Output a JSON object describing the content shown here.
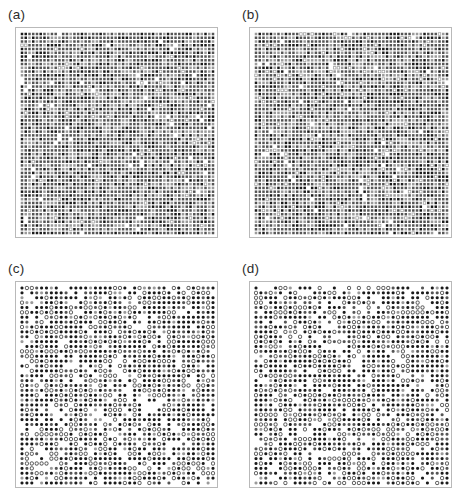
{
  "figure": {
    "width": 465,
    "height": 503,
    "background_color": "#ffffff",
    "frame_color": "#b9b9b9",
    "marker_dark_color": "#1a1a1a",
    "marker_mid_color": "#555555",
    "marker_light_color": "#9a9a9a"
  },
  "panels": [
    {
      "id": "a",
      "label": "(a)",
      "label_x": 8,
      "label_y": 8,
      "frame_x": 15,
      "frame_y": 27,
      "frame_w": 203,
      "frame_h": 211,
      "inset": 6,
      "cols": 52,
      "rows": 54,
      "fill_fraction": 0.955,
      "open_fraction": 0.03,
      "marker_size": 2.5,
      "seed": 1741
    },
    {
      "id": "b",
      "label": "(b)",
      "label_x": 242,
      "label_y": 8,
      "frame_x": 249,
      "frame_y": 27,
      "frame_w": 203,
      "frame_h": 211,
      "inset": 6,
      "cols": 52,
      "rows": 54,
      "fill_fraction": 0.93,
      "open_fraction": 0.05,
      "marker_size": 2.5,
      "seed": 9203
    },
    {
      "id": "c",
      "label": "(c)",
      "label_x": 8,
      "label_y": 262,
      "frame_x": 15,
      "frame_y": 281,
      "frame_w": 203,
      "frame_h": 207,
      "inset": 6,
      "cols": 40,
      "rows": 41,
      "fill_fraction": 0.6,
      "open_fraction": 0.26,
      "marker_size": 3.3,
      "seed": 4517
    },
    {
      "id": "d",
      "label": "(d)",
      "label_x": 242,
      "label_y": 262,
      "frame_x": 249,
      "frame_y": 281,
      "frame_w": 203,
      "frame_h": 207,
      "inset": 6,
      "cols": 40,
      "rows": 41,
      "fill_fraction": 0.62,
      "open_fraction": 0.25,
      "marker_size": 3.3,
      "seed": 6833
    }
  ],
  "chart_data": {
    "type": "heatmap",
    "title": "",
    "subtitle": "",
    "xlabel": "",
    "ylabel": "",
    "grid": false,
    "legend_position": "none",
    "panels": [
      {
        "name": "(a)",
        "lattice_columns": 52,
        "lattice_rows": 54,
        "total_sites": 2808,
        "occupied_fraction": 0.955,
        "open_site_fraction": 0.03,
        "vacancy_fraction": 0.045,
        "marker_states": [
          "filled",
          "open",
          "vacant"
        ]
      },
      {
        "name": "(b)",
        "lattice_columns": 52,
        "lattice_rows": 54,
        "total_sites": 2808,
        "occupied_fraction": 0.93,
        "open_site_fraction": 0.05,
        "vacancy_fraction": 0.07,
        "marker_states": [
          "filled",
          "open",
          "vacant"
        ]
      },
      {
        "name": "(c)",
        "lattice_columns": 40,
        "lattice_rows": 41,
        "total_sites": 1640,
        "occupied_fraction": 0.6,
        "open_site_fraction": 0.26,
        "vacancy_fraction": 0.14,
        "marker_states": [
          "filled",
          "open",
          "vacant"
        ]
      },
      {
        "name": "(d)",
        "lattice_columns": 40,
        "lattice_rows": 41,
        "total_sites": 1640,
        "occupied_fraction": 0.62,
        "open_site_fraction": 0.25,
        "vacancy_fraction": 0.13,
        "marker_states": [
          "filled",
          "open",
          "vacant"
        ]
      }
    ],
    "series": [
      {
        "name": "(a)",
        "values": [
          0.955,
          0.03,
          0.045
        ]
      },
      {
        "name": "(b)",
        "values": [
          0.93,
          0.05,
          0.07
        ]
      },
      {
        "name": "(c)",
        "values": [
          0.6,
          0.26,
          0.14
        ]
      },
      {
        "name": "(d)",
        "values": [
          0.62,
          0.25,
          0.13
        ]
      }
    ],
    "categories": [
      "filled",
      "open",
      "vacant"
    ]
  }
}
